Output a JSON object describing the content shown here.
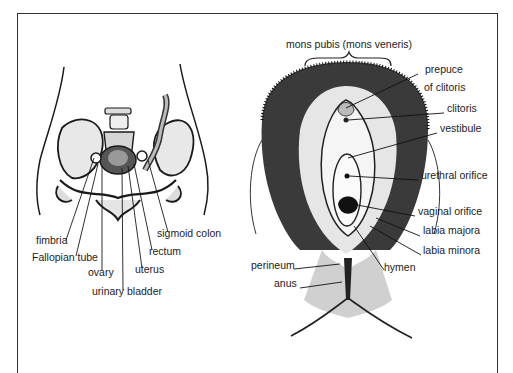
{
  "figure": {
    "left_panel": {
      "subject": "female pelvic organs (frontal view)",
      "labels": [
        {
          "id": "fimbria",
          "text": "fimbria",
          "x": 36,
          "y": 240
        },
        {
          "id": "fallopian-tube",
          "text": "Fallopian tube",
          "x": 32,
          "y": 257
        },
        {
          "id": "ovary",
          "text": "ovary",
          "x": 88,
          "y": 272
        },
        {
          "id": "urinary-bladder",
          "text": "urinary bladder",
          "x": 92,
          "y": 291
        },
        {
          "id": "uterus",
          "text": "uterus",
          "x": 135,
          "y": 269
        },
        {
          "id": "rectum",
          "text": "rectum",
          "x": 149,
          "y": 250
        },
        {
          "id": "sigmoid-colon",
          "text": "sigmoid colon",
          "x": 157,
          "y": 233
        }
      ]
    },
    "right_panel": {
      "subject": "external female genitalia",
      "heading": "mons pubis (mons veneris)",
      "labels": [
        {
          "id": "prepuce-of-clitoris-1",
          "text": "prepuce",
          "x": 425,
          "y": 69
        },
        {
          "id": "prepuce-of-clitoris-2",
          "text": "of clitoris",
          "x": 424,
          "y": 87
        },
        {
          "id": "clitoris",
          "text": "clitoris",
          "x": 447,
          "y": 108
        },
        {
          "id": "vestibule",
          "text": "vestibule",
          "x": 440,
          "y": 128
        },
        {
          "id": "urethral-orifice",
          "text": "urethral orifice",
          "x": 421,
          "y": 175
        },
        {
          "id": "vaginal-orifice",
          "text": "vaginal orifice",
          "x": 418,
          "y": 210
        },
        {
          "id": "labia-majora",
          "text": "labia majora",
          "x": 423,
          "y": 230
        },
        {
          "id": "labia-minora",
          "text": "labia minora",
          "x": 423,
          "y": 250
        },
        {
          "id": "perineum",
          "text": "perineum",
          "x": 251,
          "y": 264
        },
        {
          "id": "hymen",
          "text": "hymen",
          "x": 384,
          "y": 266
        },
        {
          "id": "anus",
          "text": "anus",
          "x": 274,
          "y": 282
        }
      ]
    }
  }
}
